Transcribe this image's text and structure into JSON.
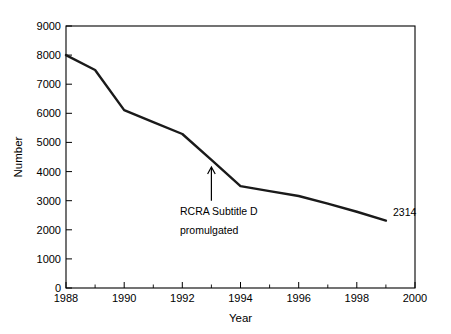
{
  "chart_data": {
    "type": "line",
    "title": "",
    "xlabel": "Year",
    "ylabel": "Number",
    "xlim": [
      1988,
      2000
    ],
    "ylim": [
      0,
      9000
    ],
    "grid": false,
    "legend": null,
    "x_ticks": [
      1988,
      1990,
      1992,
      1994,
      1996,
      1998,
      2000
    ],
    "x_tick_labels": [
      "1988",
      "1990",
      "1992",
      "1994",
      "1996",
      "1998",
      "2000"
    ],
    "x_minor_ticks": [
      1989,
      1991,
      1993,
      1995,
      1997,
      1999
    ],
    "y_ticks": [
      0,
      1000,
      2000,
      3000,
      4000,
      5000,
      6000,
      7000,
      8000,
      9000
    ],
    "y_tick_labels": [
      "0",
      "1000",
      "2000",
      "3000",
      "4000",
      "5000",
      "6000",
      "7000",
      "8000",
      "9000"
    ],
    "x": [
      1988,
      1989,
      1990,
      1991,
      1992,
      1993,
      1994,
      1995,
      1996,
      1997,
      1998,
      1999
    ],
    "values": [
      8000,
      7490,
      6110,
      5700,
      5290,
      4400,
      3500,
      3330,
      3160,
      2900,
      2620,
      2314
    ],
    "series": [
      {
        "name": "Number",
        "values": [
          8000,
          7490,
          6110,
          5700,
          5290,
          4400,
          3500,
          3330,
          3160,
          2900,
          2620,
          2314
        ]
      }
    ],
    "annotations": [
      {
        "name": "rcra-annotation",
        "line1": "RCRA Subtitle D",
        "line2": "promulgated",
        "arrow_x_year": 1993,
        "arrow_from_value": 3200,
        "arrow_to_value": 4300
      }
    ],
    "point_labels": [
      {
        "name": "end-point-label",
        "text": "2314",
        "x_year": 1999,
        "value": 2314
      }
    ]
  }
}
